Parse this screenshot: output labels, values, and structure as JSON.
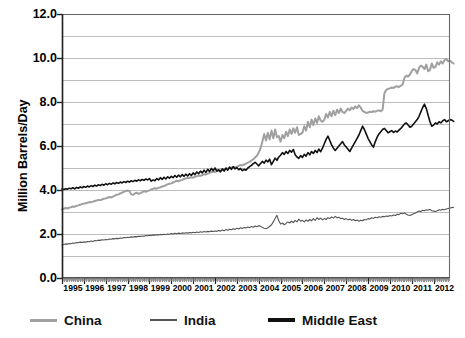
{
  "chart_data": {
    "type": "line",
    "title": "",
    "subtitle": "",
    "xlabel": "",
    "ylabel": "Million Barrels/Day",
    "xlim": [
      1995.0,
      2012.75
    ],
    "ylim": [
      0.0,
      12.0
    ],
    "grid": true,
    "grid_interval": 1.0,
    "ytick_interval": 2.0,
    "legend_position": "bottom",
    "ytick_labels": [
      "0.0",
      "2.0",
      "4.0",
      "6.0",
      "8.0",
      "10.0",
      "12.0"
    ],
    "ytick_values": [
      0.0,
      2.0,
      4.0,
      6.0,
      8.0,
      10.0,
      12.0
    ],
    "xtick_labels": [
      "1995",
      "1996",
      "1997",
      "1998",
      "1999",
      "2000",
      "2001",
      "2002",
      "2003",
      "2004",
      "2005",
      "2006",
      "2007",
      "2008",
      "2009",
      "2010",
      "2011",
      "2012"
    ],
    "xtick_values": [
      1995,
      1996,
      1997,
      1998,
      1999,
      2000,
      2001,
      2002,
      2003,
      2004,
      2005,
      2006,
      2007,
      2008,
      2009,
      2010,
      2011,
      2012
    ],
    "x_start": 1995.0,
    "x_step_months": 1,
    "series": [
      {
        "name": "China",
        "color": "#a0a0a0",
        "width": 2.0,
        "values": [
          3.12,
          3.15,
          3.18,
          3.16,
          3.2,
          3.22,
          3.25,
          3.24,
          3.28,
          3.3,
          3.33,
          3.36,
          3.38,
          3.4,
          3.42,
          3.45,
          3.44,
          3.47,
          3.5,
          3.52,
          3.55,
          3.54,
          3.57,
          3.6,
          3.62,
          3.65,
          3.68,
          3.66,
          3.7,
          3.74,
          3.78,
          3.8,
          3.84,
          3.88,
          3.92,
          3.95,
          3.98,
          3.96,
          3.8,
          3.78,
          3.84,
          3.88,
          3.82,
          3.86,
          3.9,
          3.94,
          3.92,
          3.96,
          3.98,
          4.02,
          4.05,
          4.08,
          4.06,
          4.1,
          4.12,
          4.16,
          4.18,
          4.22,
          4.26,
          4.28,
          4.3,
          4.34,
          4.38,
          4.42,
          4.4,
          4.44,
          4.46,
          4.5,
          4.52,
          4.56,
          4.55,
          4.58,
          4.56,
          4.6,
          4.62,
          4.66,
          4.64,
          4.68,
          4.72,
          4.7,
          4.74,
          4.78,
          4.8,
          4.84,
          4.82,
          4.86,
          4.9,
          4.88,
          4.92,
          4.96,
          4.94,
          4.98,
          5.0,
          5.02,
          5.05,
          5.04,
          5.06,
          5.1,
          5.14,
          5.12,
          5.16,
          5.2,
          5.24,
          5.28,
          5.34,
          5.4,
          5.48,
          5.56,
          5.7,
          5.9,
          6.2,
          6.55,
          6.25,
          6.6,
          6.3,
          6.7,
          6.35,
          6.75,
          6.4,
          6.45,
          6.2,
          6.5,
          6.35,
          6.65,
          6.45,
          6.75,
          6.55,
          6.8,
          6.6,
          6.85,
          6.5,
          6.55,
          6.6,
          6.9,
          6.7,
          7.1,
          6.85,
          7.2,
          6.95,
          7.25,
          7.05,
          7.35,
          7.15,
          7.1,
          7.2,
          7.45,
          7.3,
          7.55,
          7.35,
          7.6,
          7.4,
          7.65,
          7.5,
          7.7,
          7.55,
          7.5,
          7.6,
          7.7,
          7.62,
          7.75,
          7.68,
          7.8,
          7.72,
          7.85,
          7.74,
          7.6,
          7.55,
          7.5,
          7.52,
          7.56,
          7.54,
          7.58,
          7.56,
          7.6,
          7.62,
          7.58,
          7.65,
          8.4,
          8.55,
          8.6,
          8.62,
          8.66,
          8.64,
          8.7,
          8.72,
          8.68,
          8.74,
          8.8,
          9.1,
          9.2,
          9.15,
          9.25,
          9.4,
          9.5,
          9.45,
          9.3,
          9.55,
          9.65,
          9.6,
          9.5,
          9.7,
          9.4,
          9.45,
          9.75,
          9.55,
          9.6,
          9.8,
          9.7,
          9.85,
          9.75,
          9.9,
          9.95,
          9.85,
          9.88,
          9.8,
          9.75
        ]
      },
      {
        "name": "India",
        "color": "#555555",
        "width": 1.1,
        "values": [
          1.5,
          1.52,
          1.55,
          1.54,
          1.57,
          1.56,
          1.59,
          1.58,
          1.61,
          1.6,
          1.63,
          1.62,
          1.64,
          1.63,
          1.66,
          1.65,
          1.68,
          1.66,
          1.7,
          1.69,
          1.72,
          1.71,
          1.74,
          1.73,
          1.75,
          1.74,
          1.77,
          1.76,
          1.79,
          1.78,
          1.8,
          1.79,
          1.82,
          1.81,
          1.84,
          1.83,
          1.85,
          1.84,
          1.87,
          1.86,
          1.88,
          1.87,
          1.9,
          1.89,
          1.91,
          1.9,
          1.93,
          1.92,
          1.94,
          1.93,
          1.96,
          1.95,
          1.97,
          1.96,
          1.98,
          1.97,
          1.99,
          1.98,
          2.0,
          1.99,
          2.02,
          2.0,
          2.03,
          2.01,
          2.04,
          2.02,
          2.05,
          2.03,
          2.06,
          2.04,
          2.07,
          2.05,
          2.08,
          2.06,
          2.09,
          2.07,
          2.1,
          2.08,
          2.11,
          2.09,
          2.12,
          2.1,
          2.13,
          2.11,
          2.14,
          2.12,
          2.16,
          2.13,
          2.18,
          2.15,
          2.2,
          2.17,
          2.22,
          2.19,
          2.24,
          2.21,
          2.26,
          2.23,
          2.28,
          2.25,
          2.3,
          2.27,
          2.32,
          2.29,
          2.34,
          2.31,
          2.36,
          2.33,
          2.38,
          2.35,
          2.3,
          2.26,
          2.24,
          2.28,
          2.34,
          2.42,
          2.55,
          2.7,
          2.85,
          2.6,
          2.45,
          2.5,
          2.42,
          2.48,
          2.55,
          2.5,
          2.58,
          2.52,
          2.62,
          2.55,
          2.68,
          2.58,
          2.62,
          2.55,
          2.64,
          2.58,
          2.66,
          2.6,
          2.7,
          2.62,
          2.74,
          2.66,
          2.72,
          2.64,
          2.7,
          2.66,
          2.74,
          2.7,
          2.78,
          2.72,
          2.8,
          2.74,
          2.76,
          2.7,
          2.72,
          2.66,
          2.7,
          2.64,
          2.68,
          2.62,
          2.66,
          2.6,
          2.64,
          2.58,
          2.62,
          2.6,
          2.66,
          2.64,
          2.7,
          2.68,
          2.74,
          2.72,
          2.76,
          2.74,
          2.78,
          2.76,
          2.8,
          2.78,
          2.82,
          2.8,
          2.84,
          2.82,
          2.86,
          2.84,
          2.9,
          2.88,
          2.94,
          2.92,
          2.96,
          2.9,
          2.86,
          2.84,
          2.88,
          2.92,
          2.96,
          3.0,
          3.04,
          3.02,
          3.08,
          3.06,
          3.1,
          3.08,
          3.12,
          3.06,
          3.04,
          3.02,
          3.06,
          3.1,
          3.08,
          3.12,
          3.1,
          3.14,
          3.16,
          3.18,
          3.2,
          3.22
        ]
      },
      {
        "name": "Middle East",
        "color": "#111111",
        "width": 1.6,
        "values": [
          4.05,
          4.02,
          4.06,
          4.04,
          4.08,
          4.06,
          4.1,
          4.05,
          4.12,
          4.08,
          4.14,
          4.1,
          4.16,
          4.12,
          4.18,
          4.14,
          4.2,
          4.16,
          4.22,
          4.18,
          4.24,
          4.2,
          4.26,
          4.22,
          4.28,
          4.24,
          4.3,
          4.26,
          4.32,
          4.28,
          4.34,
          4.3,
          4.36,
          4.32,
          4.38,
          4.34,
          4.4,
          4.36,
          4.42,
          4.38,
          4.44,
          4.4,
          4.46,
          4.42,
          4.48,
          4.44,
          4.5,
          4.46,
          4.52,
          4.4,
          4.46,
          4.42,
          4.52,
          4.46,
          4.56,
          4.48,
          4.58,
          4.5,
          4.6,
          4.54,
          4.62,
          4.56,
          4.66,
          4.58,
          4.68,
          4.6,
          4.7,
          4.62,
          4.72,
          4.64,
          4.74,
          4.66,
          4.78,
          4.7,
          4.82,
          4.74,
          4.86,
          4.78,
          4.9,
          4.8,
          4.94,
          4.84,
          4.98,
          4.88,
          5.0,
          4.86,
          4.92,
          4.82,
          4.96,
          4.86,
          5.0,
          4.9,
          5.04,
          4.94,
          5.06,
          4.96,
          5.02,
          4.92,
          4.98,
          4.88,
          4.94,
          4.9,
          5.0,
          5.06,
          5.12,
          5.2,
          5.26,
          5.18,
          5.1,
          5.2,
          5.3,
          5.22,
          5.36,
          5.28,
          5.4,
          5.15,
          5.3,
          5.45,
          5.35,
          5.5,
          5.58,
          5.7,
          5.62,
          5.75,
          5.66,
          5.8,
          5.72,
          5.84,
          5.6,
          5.5,
          5.44,
          5.56,
          5.48,
          5.62,
          5.54,
          5.7,
          5.6,
          5.75,
          5.66,
          5.8,
          5.7,
          5.86,
          5.74,
          5.9,
          6.1,
          6.3,
          6.45,
          6.25,
          6.05,
          5.9,
          5.8,
          5.9,
          6.0,
          6.1,
          6.2,
          6.05,
          5.95,
          5.85,
          5.75,
          5.9,
          6.05,
          6.2,
          6.35,
          6.5,
          6.7,
          6.9,
          6.75,
          6.55,
          6.35,
          6.2,
          6.05,
          5.95,
          6.2,
          6.4,
          6.55,
          6.65,
          6.75,
          6.8,
          6.7,
          6.6,
          6.65,
          6.7,
          6.62,
          6.68,
          6.64,
          6.72,
          6.8,
          6.9,
          7.0,
          7.05,
          6.95,
          6.85,
          6.9,
          7.0,
          7.1,
          7.2,
          7.35,
          7.55,
          7.75,
          7.9,
          7.7,
          7.4,
          7.1,
          6.9,
          6.95,
          7.05,
          7.0,
          7.1,
          7.05,
          7.15,
          7.2,
          7.1,
          7.15,
          7.2,
          7.18,
          7.12
        ]
      }
    ]
  },
  "legend": {
    "items": [
      {
        "label": "China",
        "color": "#a0a0a0"
      },
      {
        "label": "India",
        "color": "#555555"
      },
      {
        "label": "Middle East",
        "color": "#111111"
      }
    ]
  },
  "axes": {
    "y_title": "Million Barrels/Day"
  }
}
